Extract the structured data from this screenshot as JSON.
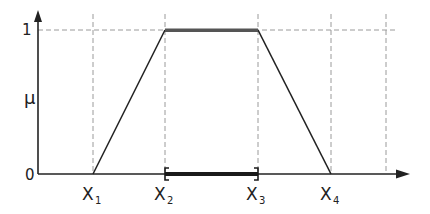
{
  "diagram": {
    "type": "trapezoidal-membership-function",
    "y_axis": {
      "label": "μ",
      "ticks": [
        {
          "label": "1",
          "value": 1
        },
        {
          "label": "0",
          "value": 0
        }
      ]
    },
    "x_axis": {
      "points": [
        {
          "base": "X",
          "sub": "1"
        },
        {
          "base": "X",
          "sub": "2"
        },
        {
          "base": "X",
          "sub": "3"
        },
        {
          "base": "X",
          "sub": "4"
        }
      ]
    },
    "shape": {
      "x1_to_x2": "rising edge 0→1",
      "x2_to_x3": "plateau at 1 (core, thick gray)",
      "x3_to_x4": "falling edge 1→0"
    },
    "core_interval": "[X2, X3] bracket on x-axis",
    "colors": {
      "line": "#222222",
      "plateau": "#555555",
      "dashed": "#9a9a9a",
      "interval": "#1a1a1a"
    }
  }
}
